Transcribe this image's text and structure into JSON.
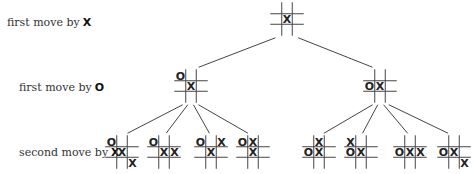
{
  "diagram": {
    "type": "game-tree",
    "title": "",
    "row_labels": [
      {
        "text": "first move by",
        "symbol": "X",
        "y": 22
      },
      {
        "text": "first move by",
        "symbol": "O",
        "y": 87
      },
      {
        "text": "second move by",
        "symbol": "X",
        "y": 153
      }
    ],
    "colors": {
      "line": "#444444",
      "text": "#222222"
    },
    "nodes": [
      {
        "id": "root",
        "cx": 287,
        "cy": 19,
        "board": [
          "",
          "",
          "",
          "",
          "X",
          "",
          "",
          "",
          ""
        ]
      },
      {
        "id": "o_corner",
        "cx": 191,
        "cy": 86,
        "board": [
          "O",
          "",
          "",
          "",
          "X",
          "",
          "",
          "",
          ""
        ]
      },
      {
        "id": "o_edge",
        "cx": 380,
        "cy": 86,
        "board": [
          "",
          "",
          "",
          "O",
          "X",
          "",
          "",
          "",
          ""
        ]
      },
      {
        "id": "c1",
        "cx": 122,
        "cy": 152,
        "board": [
          "O",
          "",
          "",
          "",
          "X",
          "",
          "",
          "",
          "X"
        ]
      },
      {
        "id": "c2",
        "cx": 164,
        "cy": 152,
        "board": [
          "O",
          "",
          "",
          "",
          "X",
          "X",
          "",
          "",
          ""
        ]
      },
      {
        "id": "c3",
        "cx": 211,
        "cy": 152,
        "board": [
          "O",
          "",
          "X",
          "",
          "X",
          "",
          "",
          "",
          ""
        ]
      },
      {
        "id": "c4",
        "cx": 253,
        "cy": 152,
        "board": [
          "O",
          "X",
          "",
          "",
          "X",
          "",
          "",
          "",
          ""
        ]
      },
      {
        "id": "c5",
        "cx": 319,
        "cy": 152,
        "board": [
          "",
          "X",
          "",
          "O",
          "X",
          "",
          "",
          "",
          ""
        ]
      },
      {
        "id": "c6",
        "cx": 361,
        "cy": 152,
        "board": [
          "X",
          "",
          "",
          "O",
          "X",
          "",
          "",
          "",
          ""
        ]
      },
      {
        "id": "c7",
        "cx": 410,
        "cy": 152,
        "board": [
          "",
          "",
          "",
          "O",
          "X",
          "X",
          "",
          "",
          ""
        ]
      },
      {
        "id": "c8",
        "cx": 454,
        "cy": 152,
        "board": [
          "",
          "",
          "",
          "O",
          "X",
          "",
          "",
          "",
          "X"
        ]
      }
    ],
    "edges": [
      {
        "from": "root",
        "to": "o_corner"
      },
      {
        "from": "root",
        "to": "o_edge"
      },
      {
        "from": "o_corner",
        "to": "c1"
      },
      {
        "from": "o_corner",
        "to": "c2"
      },
      {
        "from": "o_corner",
        "to": "c3"
      },
      {
        "from": "o_corner",
        "to": "c4"
      },
      {
        "from": "o_edge",
        "to": "c5"
      },
      {
        "from": "o_edge",
        "to": "c6"
      },
      {
        "from": "o_edge",
        "to": "c7"
      },
      {
        "from": "o_edge",
        "to": "c8"
      }
    ]
  }
}
